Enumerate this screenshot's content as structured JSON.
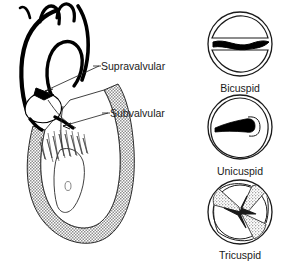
{
  "figure": {
    "background_color": "#ffffff",
    "line_color": "#000000",
    "myocardium_fill_color": "#9a9a9a",
    "chamber_fill_color": "#ffffff"
  },
  "heart_diagram": {
    "name": "left-heart-aorta-cutaway",
    "annotations": [
      {
        "id": "supravalvular",
        "label": "Supravalvular",
        "label_x": 101,
        "label_y": 70,
        "leader_from_x": 99,
        "leader_from_y": 66,
        "leader_to_x": 45,
        "leader_to_y": 91
      },
      {
        "id": "subvalvular",
        "label": "Subvalvular",
        "label_x": 110,
        "label_y": 117,
        "leader_from_x": 108,
        "leader_from_y": 113,
        "leader_to_x": 63,
        "leader_to_y": 126
      }
    ],
    "structures": [
      "ascending-aorta",
      "aortic-arch",
      "brachiocephalic-branches",
      "aortic-valve",
      "left-ventricle-cavity",
      "left-ventricle-myocardium",
      "papillary-muscle",
      "chordae-tendineae",
      "mitral-valve-leaflet"
    ]
  },
  "cusp_panels": [
    {
      "id": "bicuspid",
      "caption": "Bicuspid",
      "center_x": 240,
      "center_y": 44,
      "radius": 33,
      "caption_x": 240,
      "caption_y": 92,
      "orifice": "horizontal-wavy-slit",
      "cusp_count": 2,
      "calcified": false
    },
    {
      "id": "unicuspid",
      "caption": "Unicuspid",
      "center_x": 240,
      "center_y": 127,
      "radius": 33,
      "caption_x": 240,
      "caption_y": 175,
      "orifice": "eccentric-keyhole-slit",
      "cusp_count": 1,
      "calcified": false
    },
    {
      "id": "tricuspid",
      "caption": "Tricuspid",
      "center_x": 240,
      "center_y": 212,
      "radius": 33,
      "caption_x": 240,
      "caption_y": 259,
      "orifice": "y-shaped-triradiate-commissures",
      "cusp_count": 3,
      "calcified": true
    }
  ]
}
